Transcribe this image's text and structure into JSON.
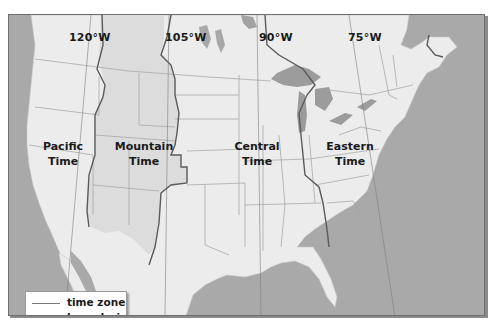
{
  "map": {
    "title": "North American time zones",
    "longitude_labels": [
      {
        "label": "120°W",
        "x": 68
      },
      {
        "label": "105°W",
        "x": 164
      },
      {
        "label": "90°W",
        "x": 258
      },
      {
        "label": "75°W",
        "x": 346
      }
    ],
    "time_zones": [
      {
        "name": "Pacific",
        "line1": "Pacific",
        "line2": "Time"
      },
      {
        "name": "Mountain",
        "line1": "Mountain",
        "line2": "Time"
      },
      {
        "name": "Central",
        "line1": "Central",
        "line2": "Time"
      },
      {
        "name": "Eastern",
        "line1": "Eastern",
        "line2": "Time"
      }
    ],
    "legend": {
      "line1": "time zone",
      "line2": "boundaries"
    },
    "colors": {
      "ocean": "#a9a9a9",
      "land": "#ececec",
      "mountain_zone_land": "#dcdcdc",
      "lakes": "#9c9c9c",
      "state_borders": "#9a9a9a",
      "timezone_boundary": "#5a5a5a",
      "label_text": "#1a1a1a"
    }
  }
}
